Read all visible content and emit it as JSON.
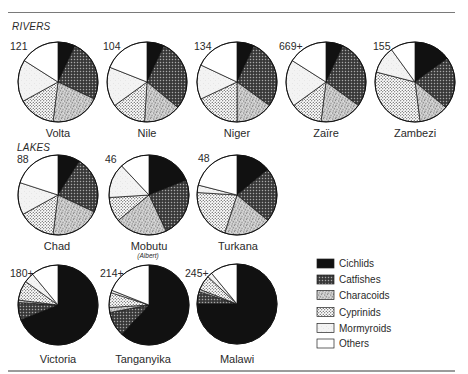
{
  "sections": {
    "rivers_label": "RIVERS",
    "lakes_label": "LAKES"
  },
  "legend": {
    "items": [
      {
        "label": "Cichlids",
        "swatch": "solid black",
        "color": "#111111"
      },
      {
        "label": "Catfishes",
        "swatch": "dark crosshatch",
        "color": "#505050"
      },
      {
        "label": "Characoids",
        "swatch": "grey stipple",
        "color": "#b0b0b0"
      },
      {
        "label": "Cyprinids",
        "swatch": "black dots on white",
        "color": "#dddddd"
      },
      {
        "label": "Mormyroids",
        "swatch": "very light grey",
        "color": "#f0f0f0"
      },
      {
        "label": "Others",
        "swatch": "white",
        "color": "#ffffff"
      }
    ]
  },
  "chart_data": {
    "type": "pie",
    "title": "",
    "value_units": "approximate % of fish species per family group (read from slice angles)",
    "categories": [
      "Cichlids",
      "Catfishes",
      "Characoids",
      "Cyprinids",
      "Mormyroids",
      "Others"
    ],
    "slice_order": "clockwise from 12 o'clock",
    "legend_position": "bottom-right",
    "pies": [
      {
        "group": "RIVERS",
        "name": "Volta",
        "subtitle": "",
        "species_count": "121",
        "values": [
          7,
          25,
          20,
          15,
          17,
          16
        ]
      },
      {
        "group": "RIVERS",
        "name": "Nile",
        "subtitle": "",
        "species_count": "104",
        "values": [
          7,
          29,
          15,
          14,
          16,
          19
        ]
      },
      {
        "group": "RIVERS",
        "name": "Niger",
        "subtitle": "",
        "species_count": "134",
        "values": [
          7,
          28,
          15,
          18,
          14,
          18
        ]
      },
      {
        "group": "RIVERS",
        "name": "Zaïre",
        "subtitle": "",
        "species_count": "669+",
        "values": [
          7,
          28,
          17,
          13,
          19,
          16
        ]
      },
      {
        "group": "RIVERS",
        "name": "Zambezi",
        "subtitle": "",
        "species_count": "155",
        "values": [
          15,
          21,
          12,
          31,
          11,
          10
        ]
      },
      {
        "group": "LAKES",
        "name": "Chad",
        "subtitle": "",
        "species_count": "88",
        "values": [
          9,
          23,
          20,
          15,
          13,
          20
        ]
      },
      {
        "group": "LAKES",
        "name": "Mobutu",
        "subtitle": "(Albert)",
        "species_count": "46",
        "values": [
          19,
          24,
          21,
          10,
          14,
          12
        ]
      },
      {
        "group": "LAKES",
        "name": "Turkana",
        "subtitle": "",
        "species_count": "48",
        "values": [
          14,
          22,
          19,
          21,
          3,
          21
        ]
      },
      {
        "group": "LAKES",
        "name": "Victoria",
        "subtitle": "",
        "species_count": "180+",
        "values": [
          69,
          7,
          1,
          8,
          4,
          11
        ]
      },
      {
        "group": "LAKES",
        "name": "Tanganyika",
        "subtitle": "",
        "species_count": "214+",
        "values": [
          62,
          10,
          2,
          6,
          1,
          19
        ]
      },
      {
        "group": "LAKES",
        "name": "Malawi",
        "subtitle": "",
        "species_count": "245+",
        "values": [
          75,
          5,
          1,
          6,
          2,
          11
        ]
      }
    ]
  }
}
